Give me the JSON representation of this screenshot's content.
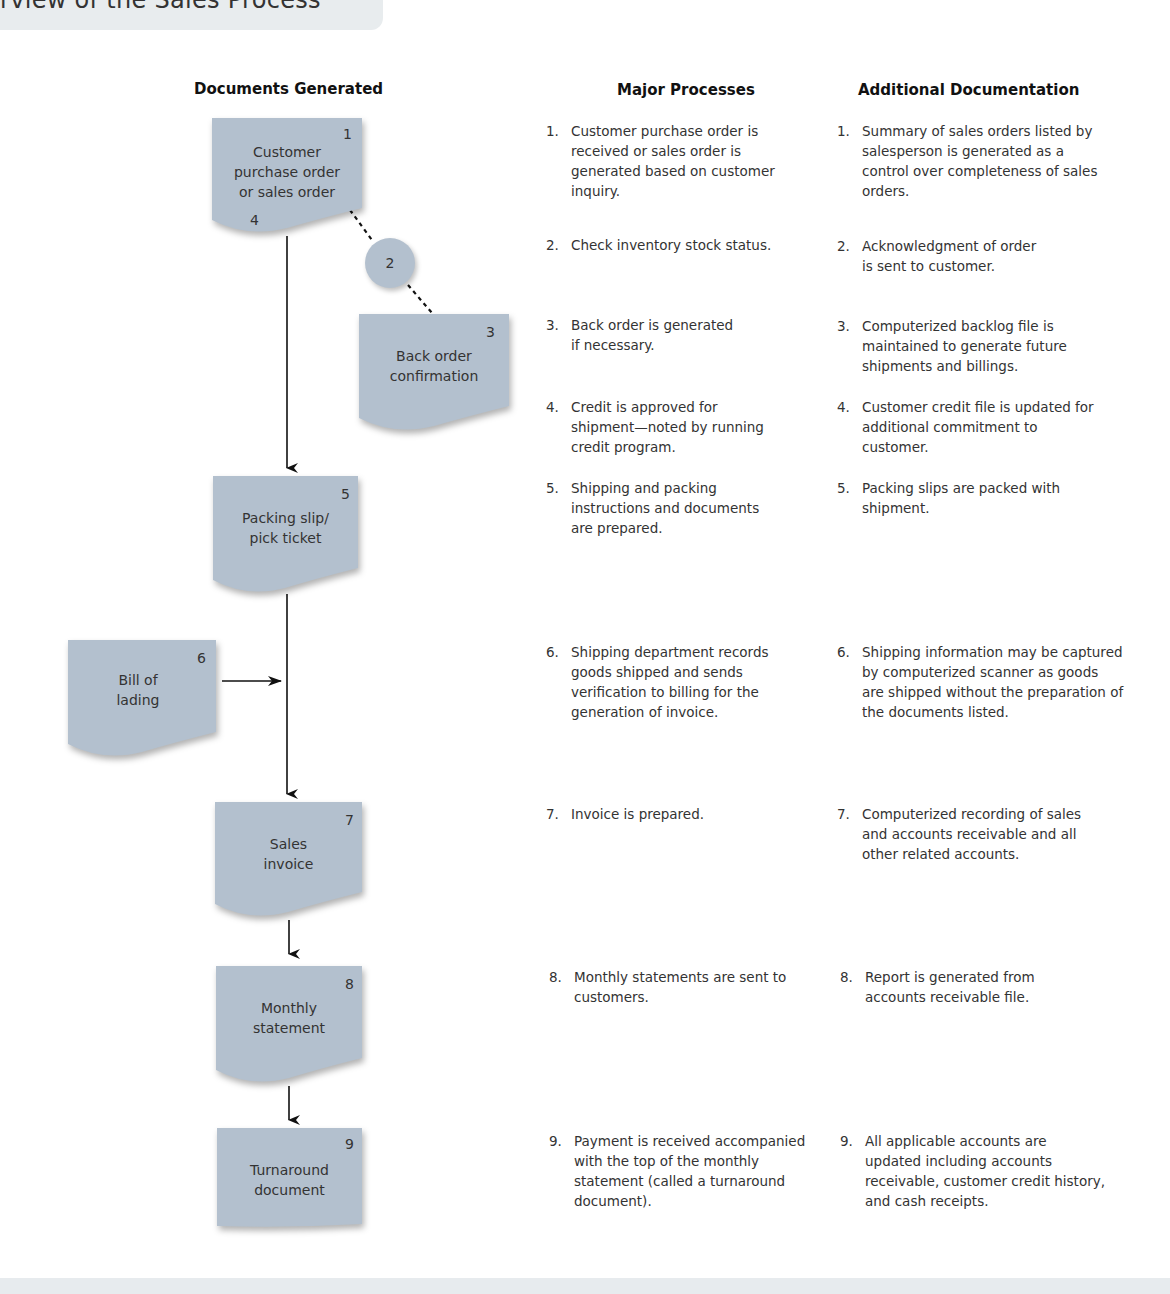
{
  "header": {
    "title_fragment": "rview of the Sales Process"
  },
  "columns": {
    "documents": "Documents Generated",
    "processes": "Major Processes",
    "additional": "Additional Documentation"
  },
  "documents": [
    {
      "num": "1",
      "label": "Customer\npurchase order\nor sales order",
      "sub_num": "4"
    },
    {
      "num": "2",
      "label": ""
    },
    {
      "num": "3",
      "label": "Back order\nconfirmation"
    },
    {
      "num": "5",
      "label": "Packing slip/\npick ticket"
    },
    {
      "num": "6",
      "label": "Bill of\nlading"
    },
    {
      "num": "7",
      "label": "Sales\ninvoice"
    },
    {
      "num": "8",
      "label": "Monthly\nstatement"
    },
    {
      "num": "9",
      "label": "Turnaround\ndocument"
    }
  ],
  "processes": [
    {
      "n": "1.",
      "text": "Customer purchase order is\nreceived or sales order is\ngenerated based on customer\ninquiry."
    },
    {
      "n": "2.",
      "text": "Check inventory stock status."
    },
    {
      "n": "3.",
      "text": "Back order is generated\n if necessary."
    },
    {
      "n": "4.",
      "text": "Credit is approved for\nshipment—noted by running\ncredit program."
    },
    {
      "n": "5.",
      "text": "Shipping and packing\ninstructions and documents\nare prepared."
    },
    {
      "n": "6.",
      "text": "Shipping department records\ngoods shipped and sends\nverification to billing for the\ngeneration of invoice."
    },
    {
      "n": "7.",
      "text": "Invoice is prepared."
    },
    {
      "n": "8.",
      "text": "Monthly statements are sent to\ncustomers."
    },
    {
      "n": "9.",
      "text": "Payment is received accompanied\nwith the top of the monthly\nstatement (called a turnaround\ndocument)."
    }
  ],
  "additional": [
    {
      "n": "1.",
      "text": "Summary of sales orders listed by\nsalesperson is generated as a\ncontrol over completeness of sales\norders."
    },
    {
      "n": "2.",
      "text": "Acknowledgment of order\nis sent to customer."
    },
    {
      "n": "3.",
      "text": "Computerized backlog file is\nmaintained to generate future\nshipments and billings."
    },
    {
      "n": "4.",
      "text": "Customer credit file is updated for\nadditional commitment to\ncustomer."
    },
    {
      "n": "5.",
      "text": "Packing slips are packed with\nshipment."
    },
    {
      "n": "6.",
      "text": "Shipping information may be captured\nby computerized scanner as goods\nare shipped without the preparation of\nthe documents listed."
    },
    {
      "n": "7.",
      "text": "Computerized recording of sales\nand accounts receivable and all\nother related accounts."
    },
    {
      "n": "8.",
      "text": "Report is generated from\naccounts receivable file."
    },
    {
      "n": "9.",
      "text": "All applicable accounts are\nupdated including accounts\nreceivable, customer credit history,\nand cash receipts."
    }
  ],
  "colors": {
    "doc_fill": "#b3c0ce",
    "title_band": "#e8ecee",
    "line": "#111111"
  }
}
